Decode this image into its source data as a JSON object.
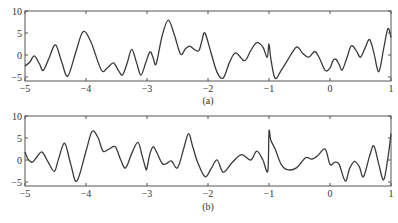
{
  "chart_data": [
    {
      "type": "line",
      "title": "",
      "panel_label": "(a)",
      "xlabel": "",
      "ylabel": "",
      "xlim": [
        -5,
        1
      ],
      "ylim": [
        -6,
        10
      ],
      "xticks": [
        -5,
        -4,
        -3,
        -2,
        -1,
        0,
        1
      ],
      "xtick_labels": [
        "−5",
        "−4",
        "−3",
        "−2",
        "−1",
        "0",
        "1"
      ],
      "yticks": [
        10,
        5,
        0,
        -5
      ],
      "ytick_labels": [
        "10",
        "5",
        "0",
        "−5"
      ],
      "grid": false,
      "series": [
        {
          "name": "signal (a)",
          "x": [
            -5.0,
            -4.92,
            -4.85,
            -4.77,
            -4.7,
            -4.6,
            -4.5,
            -4.4,
            -4.3,
            -4.17,
            -4.05,
            -3.92,
            -3.75,
            -3.65,
            -3.55,
            -3.47,
            -3.4,
            -3.32,
            -3.25,
            -3.17,
            -3.1,
            -3.02,
            -2.95,
            -2.9,
            -2.85,
            -2.75,
            -2.65,
            -2.55,
            -2.45,
            -2.37,
            -2.3,
            -2.22,
            -2.15,
            -2.1,
            -2.05,
            -1.95,
            -1.85,
            -1.75,
            -1.65,
            -1.55,
            -1.4,
            -1.3,
            -1.2,
            -1.1,
            -1.03,
            -1.0,
            -0.97,
            -0.9,
            -0.8,
            -0.7,
            -0.55,
            -0.45,
            -0.35,
            -0.25,
            -0.17,
            -0.08,
            0.0,
            0.05,
            0.1,
            0.15,
            0.2,
            0.28,
            0.35,
            0.43,
            0.5,
            0.58,
            0.65,
            0.72,
            0.8,
            0.88,
            0.95,
            1.0
          ],
          "y": [
            -2.5,
            -1.6,
            -0.2,
            -1.8,
            -3.5,
            -0.5,
            2.3,
            -1.5,
            -4.8,
            0.5,
            5.3,
            3.0,
            -3.4,
            -2.9,
            -1.8,
            -3.5,
            -4.5,
            -1.6,
            1.3,
            -1.8,
            -4.6,
            -1.7,
            0.7,
            -0.6,
            -2.0,
            4.5,
            7.9,
            4.5,
            0.2,
            1.4,
            2.0,
            1.2,
            1.0,
            3.2,
            5.0,
            0.5,
            -4.0,
            -5.2,
            -1.8,
            0.5,
            -1.3,
            1.0,
            2.8,
            1.8,
            -0.5,
            2.5,
            -0.8,
            -5.3,
            -3.5,
            -1.3,
            1.8,
            0.4,
            -0.5,
            0.8,
            -0.8,
            -3.5,
            -3.0,
            -1.2,
            -1.0,
            -2.2,
            -3.4,
            -0.5,
            2.1,
            1.0,
            -0.5,
            1.8,
            3.5,
            0.5,
            -3.8,
            1.5,
            6.0,
            4.0
          ]
        }
      ]
    },
    {
      "type": "line",
      "title": "",
      "panel_label": "(b)",
      "xlabel": "",
      "ylabel": "",
      "xlim": [
        -5,
        1
      ],
      "ylim": [
        -6,
        10
      ],
      "xticks": [
        -5,
        -4,
        -3,
        -2,
        -1,
        0,
        1
      ],
      "xtick_labels": [
        "−5",
        "−4",
        "−3",
        "−2",
        "−1",
        "0",
        "1"
      ],
      "yticks": [
        10,
        5,
        0,
        -5
      ],
      "ytick_labels": [
        "10",
        "5",
        "0",
        "−5"
      ],
      "grid": false,
      "series": [
        {
          "name": "signal (b)",
          "x": [
            -5.0,
            -4.95,
            -4.88,
            -4.8,
            -4.72,
            -4.62,
            -4.52,
            -4.45,
            -4.35,
            -4.25,
            -4.15,
            -4.0,
            -3.9,
            -3.8,
            -3.72,
            -3.62,
            -3.52,
            -3.43,
            -3.35,
            -3.25,
            -3.15,
            -3.08,
            -3.02,
            -3.0,
            -2.95,
            -2.9,
            -2.85,
            -2.75,
            -2.68,
            -2.6,
            -2.5,
            -2.4,
            -2.32,
            -2.25,
            -2.17,
            -2.05,
            -1.95,
            -1.85,
            -1.75,
            -1.6,
            -1.45,
            -1.3,
            -1.2,
            -1.1,
            -1.02,
            -1.0,
            -0.97,
            -0.9,
            -0.8,
            -0.7,
            -0.55,
            -0.4,
            -0.3,
            -0.2,
            -0.08,
            0.0,
            0.08,
            0.15,
            0.25,
            0.32,
            0.4,
            0.48,
            0.55,
            0.65,
            0.72,
            0.8,
            0.88,
            0.95,
            1.0
          ],
          "y": [
            1.8,
            0.2,
            -0.5,
            0.8,
            1.8,
            -0.5,
            -2.6,
            0.2,
            3.8,
            -1.0,
            -4.8,
            2.0,
            6.5,
            5.0,
            2.0,
            2.5,
            3.0,
            0.0,
            -1.8,
            1.5,
            4.0,
            1.0,
            -2.0,
            -1.8,
            1.5,
            3.0,
            2.0,
            -0.8,
            -0.8,
            -0.2,
            -1.8,
            2.5,
            6.0,
            3.0,
            -0.5,
            -3.8,
            -2.0,
            0.0,
            -2.8,
            -0.5,
            1.2,
            0.0,
            2.0,
            0.0,
            -2.5,
            6.5,
            4.5,
            2.5,
            -1.0,
            -2.2,
            -1.8,
            0.5,
            0.2,
            1.0,
            2.5,
            -1.0,
            -0.5,
            -1.0,
            -4.8,
            -2.0,
            -0.3,
            -1.5,
            -3.8,
            1.0,
            3.2,
            -1.0,
            -4.5,
            0.5,
            6.0
          ]
        }
      ]
    }
  ],
  "figure": {
    "panels": [
      {
        "label": "(a)"
      },
      {
        "label": "(b)"
      }
    ]
  }
}
